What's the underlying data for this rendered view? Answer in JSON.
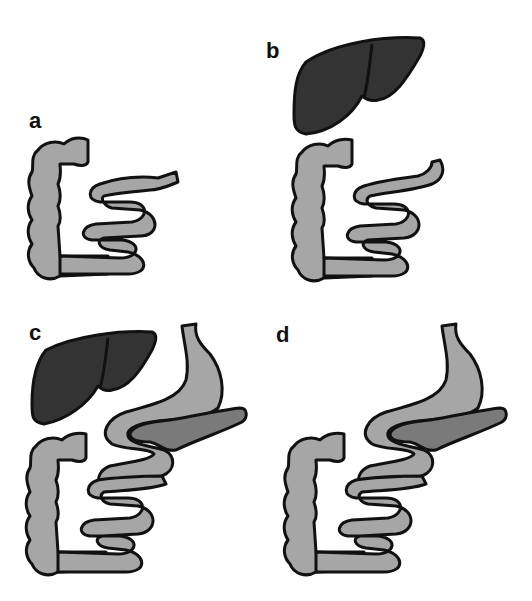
{
  "figure": {
    "panels": [
      {
        "id": "a",
        "label": "a",
        "organs": [
          "colon",
          "small-intestine"
        ]
      },
      {
        "id": "b",
        "label": "b",
        "organs": [
          "liver",
          "colon",
          "small-intestine"
        ]
      },
      {
        "id": "c",
        "label": "c",
        "organs": [
          "liver",
          "stomach",
          "pancreas",
          "colon",
          "small-intestine"
        ]
      },
      {
        "id": "d",
        "label": "d",
        "organs": [
          "stomach",
          "pancreas",
          "colon",
          "small-intestine"
        ]
      }
    ],
    "colors": {
      "outline": "#111111",
      "intestine": "#a6a6a6",
      "liver": "#333333",
      "pancreas": "#7a7a7a",
      "background": "#ffffff"
    }
  }
}
